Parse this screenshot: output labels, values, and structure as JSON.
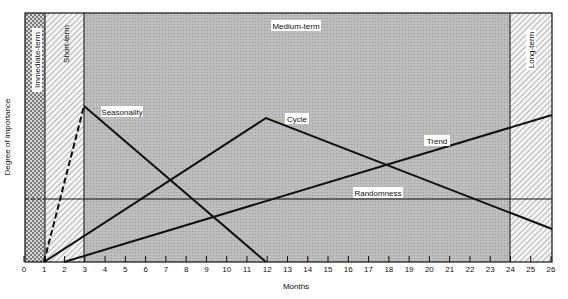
{
  "chart_data": {
    "type": "line",
    "title": "",
    "xlabel": "Months",
    "ylabel": "Degree of importance",
    "xlim": [
      0,
      26
    ],
    "ylim": [
      0,
      100
    ],
    "x_ticks": [
      0,
      1,
      2,
      3,
      4,
      5,
      6,
      7,
      8,
      9,
      10,
      11,
      12,
      13,
      14,
      15,
      16,
      17,
      18,
      19,
      20,
      21,
      22,
      23,
      24,
      25,
      26
    ],
    "grid": false,
    "regions": [
      {
        "name": "Immediate-term",
        "x_start": 0,
        "x_end": 1,
        "pattern": "crosshatch"
      },
      {
        "name": "Short-term",
        "x_start": 1,
        "x_end": 3,
        "pattern": "diagonal-hatch"
      },
      {
        "name": "Medium-term",
        "x_start": 3,
        "x_end": 24,
        "pattern": "gray-dots"
      },
      {
        "name": "Long-term",
        "x_start": 24,
        "x_end": 26,
        "pattern": "diagonal-hatch"
      }
    ],
    "series": [
      {
        "name": "Seasonality",
        "points": [
          [
            1,
            0
          ],
          [
            3,
            63
          ],
          [
            12,
            0
          ]
        ],
        "dashed_segment": [
          1,
          3
        ]
      },
      {
        "name": "Cycle",
        "points": [
          [
            1,
            0
          ],
          [
            12,
            58
          ],
          [
            26,
            13
          ]
        ]
      },
      {
        "name": "Trend",
        "points": [
          [
            2,
            0
          ],
          [
            26,
            59
          ]
        ]
      },
      {
        "name": "Randomness",
        "points": [
          [
            0,
            25
          ],
          [
            26,
            25
          ]
        ],
        "dashed_segment": [
          0,
          1
        ]
      }
    ],
    "labels": {
      "immediate": "Immediate-term",
      "short": "Short-term",
      "medium": "Medium-term",
      "long": "Long-term",
      "seasonality": "Seasonality",
      "cycle": "Cycle",
      "trend": "Trend",
      "randomness": "Randomness"
    }
  },
  "colors": {
    "medium_fill": "#b9b9b9",
    "hatch_bg": "#f2f2f2",
    "line": "#111111"
  }
}
